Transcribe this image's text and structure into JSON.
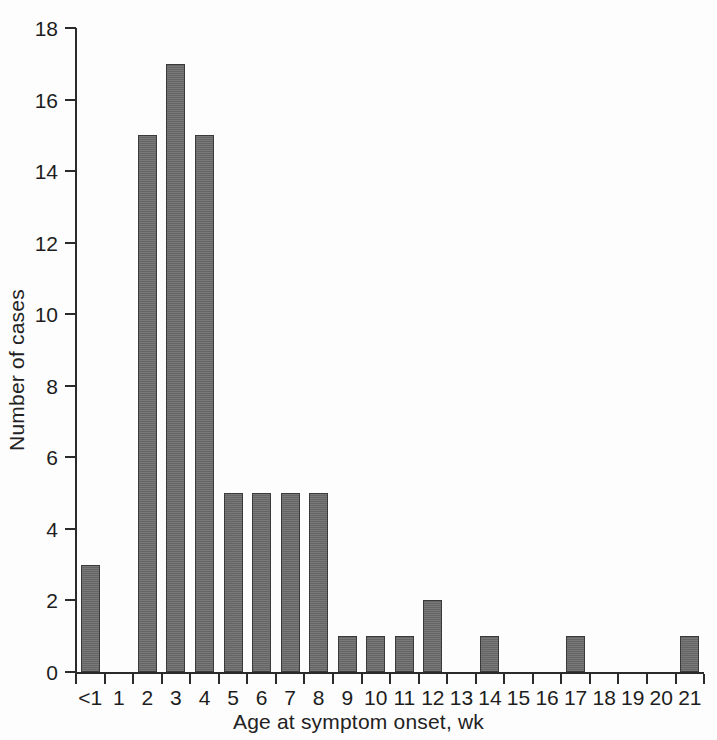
{
  "chart_data": {
    "type": "bar",
    "title": "",
    "xlabel": "Age at symptom onset, wk",
    "ylabel": "Number of cases",
    "categories": [
      "<1",
      "1",
      "2",
      "3",
      "4",
      "5",
      "6",
      "7",
      "8",
      "9",
      "10",
      "11",
      "12",
      "13",
      "14",
      "15",
      "16",
      "17",
      "18",
      "19",
      "20",
      "21"
    ],
    "values": [
      3,
      0,
      15,
      17,
      15,
      5,
      5,
      5,
      5,
      1,
      1,
      1,
      2,
      0,
      1,
      0,
      0,
      1,
      0,
      0,
      0,
      1
    ],
    "ylim": [
      0,
      18
    ],
    "ytick_values": [
      0,
      2,
      4,
      6,
      8,
      10,
      12,
      14,
      16,
      18
    ],
    "ytick_labels": [
      "0",
      "2",
      "4",
      "6",
      "8",
      "10",
      "12",
      "14",
      "16",
      "18"
    ],
    "grid": false,
    "legend": null,
    "bar_color": "#6a6a6a",
    "bar_edge_color": "#3a3a3a",
    "axis_color": "#2b2b2b",
    "background_color": "#fdfdfd",
    "total_cases": 57
  }
}
